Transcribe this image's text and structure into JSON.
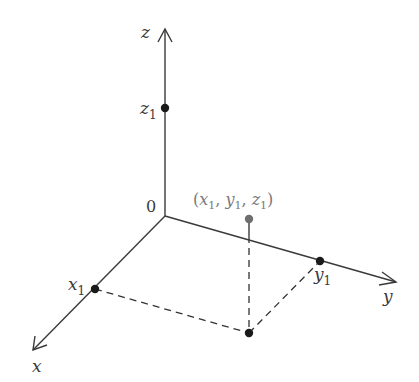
{
  "diagram": {
    "axes": {
      "x": {
        "label": "x"
      },
      "y": {
        "label": "y"
      },
      "z": {
        "label": "z"
      }
    },
    "origin": {
      "label": "0"
    },
    "points": {
      "x1": {
        "label": "x",
        "subscript": "1"
      },
      "y1": {
        "label": "y",
        "subscript": "1"
      },
      "z1": {
        "label": "z",
        "subscript": "1"
      },
      "p": {
        "open": "(",
        "x": "x",
        "xs": "1",
        "sep1": ", ",
        "y": "y",
        "ys": "1",
        "sep2": ", ",
        "z": "z",
        "zs": "1",
        "close": ")"
      }
    },
    "colors": {
      "axis": "#3a3a3a",
      "point": "#1a1a1a",
      "highlight_point": "#6e6e6e",
      "highlight_label": "#7a7a7a"
    }
  }
}
